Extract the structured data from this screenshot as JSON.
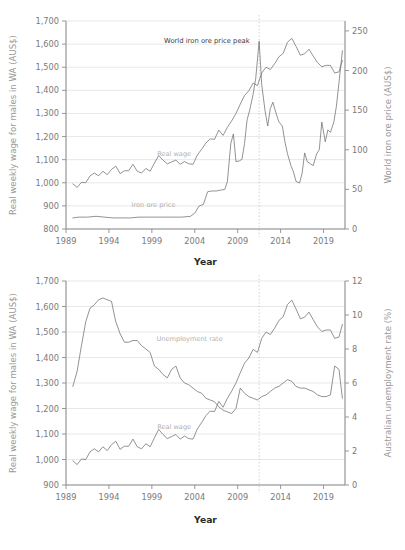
{
  "figure": {
    "background": "#ffffff",
    "series_color": "#6f6f6f",
    "grid_color": "#d9d9d9",
    "axis_color": "#8c8c8c",
    "label_color": "#7a7a7a",
    "marker_color": "#c9c9c9"
  },
  "chart_data": [
    {
      "id": "top",
      "type": "line",
      "title": "",
      "xlabel": "Year",
      "ylabel": "Real weekly wage for males in WA (AUS$)",
      "y2label": "World iron ore price (AUS$)",
      "xlim": [
        1989,
        2021.5
      ],
      "ylim": [
        800,
        1700
      ],
      "y2lim": [
        0,
        262.5
      ],
      "xticks": [
        1989,
        1994,
        1999,
        2004,
        2009,
        2014,
        2019
      ],
      "yticks": [
        800,
        900,
        1000,
        1100,
        1200,
        1300,
        1400,
        1500,
        1600,
        1700
      ],
      "y2ticks": [
        0,
        50,
        100,
        150,
        200,
        250
      ],
      "grid": true,
      "legend": "inline-labels",
      "annotations": [
        {
          "text": "World iron ore price peak",
          "x": 2010.4,
          "y": 1603,
          "align": "end"
        }
      ],
      "vline": {
        "x": 2011.5,
        "style": "dotted"
      },
      "series": [
        {
          "name": "Real wage",
          "axis": "left",
          "label_x": 2001.6,
          "label_y": 1118,
          "x": [
            1989.8,
            1990.3,
            1990.8,
            1991.3,
            1991.8,
            1992.3,
            1992.8,
            1993.3,
            1993.8,
            1994.3,
            1994.8,
            1995.3,
            1995.8,
            1996.3,
            1996.8,
            1997.3,
            1997.8,
            1998.3,
            1998.8,
            1999.3,
            1999.8,
            2000.3,
            2000.8,
            2001.3,
            2001.8,
            2002.3,
            2002.8,
            2003.3,
            2003.8,
            2004.3,
            2004.8,
            2005.3,
            2005.8,
            2006.3,
            2006.8,
            2007.3,
            2007.8,
            2008.3,
            2008.8,
            2009.3,
            2009.8,
            2010.3,
            2010.8,
            2011.3,
            2011.8,
            2012.3,
            2012.8,
            2013.3,
            2013.8,
            2014.3,
            2014.8,
            2015.3,
            2015.8,
            2016.3,
            2016.8,
            2017.3,
            2017.8,
            2018.3,
            2018.8,
            2019.3,
            2019.8,
            2020.3,
            2020.8,
            2021.2
          ],
          "y": [
            995,
            980,
            1002,
            1000,
            1030,
            1042,
            1030,
            1050,
            1035,
            1058,
            1072,
            1040,
            1052,
            1052,
            1080,
            1050,
            1042,
            1062,
            1050,
            1085,
            1118,
            1098,
            1082,
            1090,
            1098,
            1080,
            1092,
            1082,
            1080,
            1120,
            1145,
            1172,
            1190,
            1188,
            1228,
            1205,
            1240,
            1268,
            1300,
            1340,
            1378,
            1398,
            1432,
            1420,
            1475,
            1500,
            1490,
            1515,
            1545,
            1560,
            1608,
            1625,
            1590,
            1552,
            1558,
            1578,
            1548,
            1520,
            1502,
            1508,
            1508,
            1475,
            1480,
            1530
          ]
        },
        {
          "name": "Iron ore price",
          "axis": "right",
          "label_x": 1999.2,
          "label_y_right": 28,
          "x": [
            1989.8,
            1990.5,
            1991.5,
            1992.5,
            1993.5,
            1994.5,
            1995.5,
            1996.5,
            1997.5,
            1998.5,
            1999.5,
            2000.5,
            2001.5,
            2002.5,
            2003.5,
            2004.0,
            2004.5,
            2005.0,
            2005.5,
            2006.0,
            2006.5,
            2007.0,
            2007.5,
            2007.8,
            2008.2,
            2008.5,
            2008.8,
            2009.2,
            2009.5,
            2009.8,
            2010.1,
            2010.4,
            2010.8,
            2011.1,
            2011.5,
            2011.8,
            2012.2,
            2012.5,
            2012.8,
            2013.1,
            2013.5,
            2013.8,
            2014.2,
            2014.5,
            2014.8,
            2015.2,
            2015.5,
            2015.8,
            2016.2,
            2016.5,
            2016.8,
            2017.1,
            2017.5,
            2017.8,
            2018.2,
            2018.5,
            2018.8,
            2019.2,
            2019.5,
            2019.8,
            2020.2,
            2020.5,
            2020.8,
            2021.2
          ],
          "y": [
            14,
            15,
            15,
            16,
            15,
            14,
            14,
            14,
            15,
            15,
            15,
            15,
            15,
            15,
            16,
            20,
            29,
            31,
            47,
            48,
            48,
            49,
            50,
            60,
            108,
            120,
            85,
            86,
            88,
            108,
            138,
            150,
            170,
            190,
            237,
            182,
            148,
            130,
            152,
            160,
            145,
            135,
            130,
            110,
            95,
            80,
            72,
            60,
            58,
            70,
            96,
            85,
            82,
            80,
            95,
            100,
            135,
            110,
            125,
            122,
            135,
            155,
            185,
            225
          ]
        }
      ]
    },
    {
      "id": "bottom",
      "type": "line",
      "title": "",
      "xlabel": "Year",
      "ylabel": "Real weekly wage for males in WA (AUS$)",
      "y2label": "Australian unemployment rate (%)",
      "xlim": [
        1989,
        2021.5
      ],
      "ylim": [
        900,
        1700
      ],
      "y2lim": [
        0,
        12
      ],
      "xticks": [
        1989,
        1994,
        1999,
        2004,
        2009,
        2014,
        2019
      ],
      "yticks": [
        900,
        1000,
        1100,
        1200,
        1300,
        1400,
        1500,
        1600,
        1700
      ],
      "y2ticks": [
        0,
        2,
        4,
        6,
        8,
        10,
        12
      ],
      "grid": true,
      "legend": "inline-labels",
      "annotations": [],
      "vline": {
        "x": 2011.5,
        "style": "dotted"
      },
      "series": [
        {
          "name": "Unemployment rate",
          "axis": "right",
          "label_x": 2003.4,
          "label_y_right": 8.45,
          "x": [
            1989.8,
            1990.3,
            1990.8,
            1991.3,
            1991.8,
            1992.3,
            1992.8,
            1993.3,
            1993.8,
            1994.3,
            1994.8,
            1995.3,
            1995.8,
            1996.3,
            1996.8,
            1997.3,
            1997.8,
            1998.3,
            1998.8,
            1999.3,
            1999.8,
            2000.3,
            2000.8,
            2001.3,
            2001.8,
            2002.3,
            2002.8,
            2003.3,
            2003.8,
            2004.3,
            2004.8,
            2005.3,
            2005.8,
            2006.3,
            2006.8,
            2007.3,
            2007.8,
            2008.3,
            2008.8,
            2009.3,
            2009.8,
            2010.3,
            2010.8,
            2011.3,
            2011.8,
            2012.3,
            2012.8,
            2013.3,
            2013.8,
            2014.3,
            2014.8,
            2015.3,
            2015.8,
            2016.3,
            2016.8,
            2017.3,
            2017.8,
            2018.3,
            2018.8,
            2019.3,
            2019.8,
            2020.3,
            2020.8,
            2021.2
          ],
          "y": [
            5.8,
            6.7,
            8.2,
            9.6,
            10.4,
            10.6,
            10.9,
            11.0,
            10.9,
            10.8,
            9.6,
            8.9,
            8.4,
            8.4,
            8.5,
            8.5,
            8.2,
            8.0,
            7.8,
            7.0,
            6.8,
            6.5,
            6.3,
            6.8,
            7.0,
            6.3,
            6.0,
            5.9,
            5.7,
            5.5,
            5.4,
            5.1,
            5.0,
            4.9,
            4.6,
            4.4,
            4.3,
            4.2,
            4.5,
            5.7,
            5.4,
            5.2,
            5.1,
            5.0,
            5.2,
            5.3,
            5.5,
            5.7,
            5.8,
            6.0,
            6.2,
            6.1,
            5.8,
            5.7,
            5.7,
            5.6,
            5.5,
            5.3,
            5.2,
            5.2,
            5.3,
            7.0,
            6.8,
            5.1
          ]
        },
        {
          "name": "Real wage",
          "axis": "left",
          "label_x": 2001.6,
          "label_y": 1118,
          "x": [
            1989.8,
            1990.3,
            1990.8,
            1991.3,
            1991.8,
            1992.3,
            1992.8,
            1993.3,
            1993.8,
            1994.3,
            1994.8,
            1995.3,
            1995.8,
            1996.3,
            1996.8,
            1997.3,
            1997.8,
            1998.3,
            1998.8,
            1999.3,
            1999.8,
            2000.3,
            2000.8,
            2001.3,
            2001.8,
            2002.3,
            2002.8,
            2003.3,
            2003.8,
            2004.3,
            2004.8,
            2005.3,
            2005.8,
            2006.3,
            2006.8,
            2007.3,
            2007.8,
            2008.3,
            2008.8,
            2009.3,
            2009.8,
            2010.3,
            2010.8,
            2011.3,
            2011.8,
            2012.3,
            2012.8,
            2013.3,
            2013.8,
            2014.3,
            2014.8,
            2015.3,
            2015.8,
            2016.3,
            2016.8,
            2017.3,
            2017.8,
            2018.3,
            2018.8,
            2019.3,
            2019.8,
            2020.3,
            2020.8,
            2021.2
          ],
          "y": [
            995,
            980,
            1002,
            1000,
            1030,
            1042,
            1030,
            1050,
            1035,
            1058,
            1072,
            1040,
            1052,
            1052,
            1080,
            1050,
            1042,
            1062,
            1050,
            1085,
            1118,
            1098,
            1082,
            1090,
            1098,
            1080,
            1092,
            1082,
            1080,
            1120,
            1145,
            1172,
            1190,
            1188,
            1228,
            1205,
            1240,
            1268,
            1300,
            1340,
            1378,
            1398,
            1432,
            1420,
            1475,
            1500,
            1490,
            1515,
            1545,
            1560,
            1608,
            1625,
            1590,
            1552,
            1558,
            1578,
            1548,
            1520,
            1502,
            1508,
            1508,
            1475,
            1480,
            1530
          ]
        }
      ]
    }
  ]
}
